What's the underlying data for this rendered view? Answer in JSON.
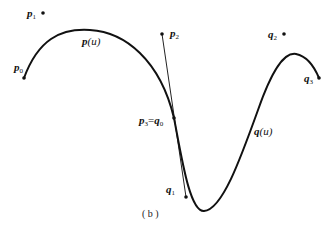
{
  "figure": {
    "caption": "( b )",
    "curves": [
      {
        "id": "p",
        "label": "p(u)"
      },
      {
        "id": "q",
        "label": "q(u)"
      }
    ],
    "points": {
      "p0": {
        "base": "p",
        "sub": "0"
      },
      "p1": {
        "base": "p",
        "sub": "1"
      },
      "p2": {
        "base": "p",
        "sub": "2"
      },
      "p3q0": {
        "base": "p",
        "sub": "3",
        "eq": "=",
        "base2": "q",
        "sub2": "0"
      },
      "q1": {
        "base": "q",
        "sub": "1"
      },
      "q2": {
        "base": "q",
        "sub": "2"
      },
      "q3": {
        "base": "q",
        "sub": "3"
      }
    },
    "labels": {
      "pu_base": "p",
      "pu_arg": "(u)",
      "qu_base": "q",
      "qu_arg": "(u)"
    },
    "colors": {
      "stroke": "#111111",
      "background": "#ffffff"
    }
  }
}
